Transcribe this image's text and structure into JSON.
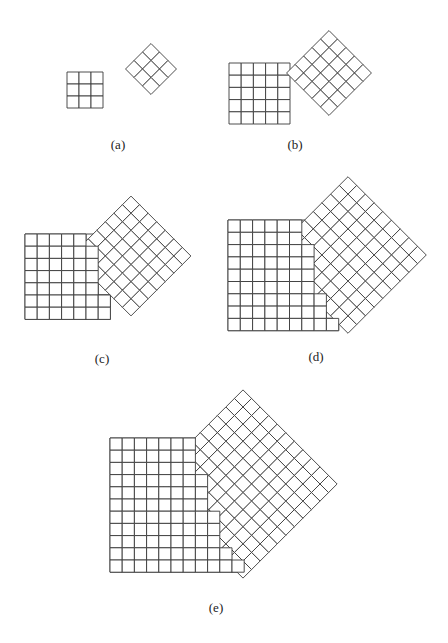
{
  "figure": {
    "line_color": "#3a3a3a",
    "fill_color": "#ffffff",
    "panels": [
      {
        "id": "a",
        "label": "(a)",
        "label_pos": [
          118,
          145
        ],
        "square": {
          "n": 3,
          "x": 67,
          "y": 72,
          "cell": 12
        },
        "diamond": {
          "n": 3,
          "cx": 151,
          "cy": 69,
          "cell": 12
        },
        "square_front_cols": null
      },
      {
        "id": "b",
        "label": "(b)",
        "label_pos": [
          295,
          145
        ],
        "square": {
          "n": 5,
          "x": 229,
          "y": 63,
          "cell": 12.2
        },
        "diamond": {
          "n": 5,
          "cx": 329,
          "cy": 73,
          "cell": 12
        },
        "square_front_cols": null
      },
      {
        "id": "c",
        "label": "(c)",
        "label_pos": [
          102,
          359
        ],
        "square": {
          "n": 7,
          "x": 25,
          "y": 234,
          "cell": 12.2
        },
        "diamond": {
          "n": 7,
          "cx": 131,
          "cy": 256,
          "cell": 12.1
        },
        "square_front_cols": [
          5,
          6,
          6,
          6,
          6,
          7,
          7
        ]
      },
      {
        "id": "d",
        "label": "(d)",
        "label_pos": [
          316,
          357
        ],
        "square": {
          "n": 9,
          "x": 228,
          "y": 220,
          "cell": 12.3
        },
        "diamond": {
          "n": 9,
          "cx": 348,
          "cy": 255,
          "cell": 12.3
        },
        "square_front_cols": [
          6,
          6,
          7,
          7,
          7,
          7,
          8,
          8,
          9
        ]
      },
      {
        "id": "e",
        "label": "(e)",
        "label_pos": [
          216,
          608
        ],
        "square": {
          "n": 11,
          "x": 110,
          "y": 438,
          "cell": 12.2
        },
        "diamond": {
          "n": 11,
          "cx": 243,
          "cy": 484,
          "cell": 12.1
        },
        "square_front_cols": [
          7,
          7,
          7,
          8,
          8,
          8,
          9,
          9,
          9,
          10,
          11
        ]
      }
    ]
  }
}
